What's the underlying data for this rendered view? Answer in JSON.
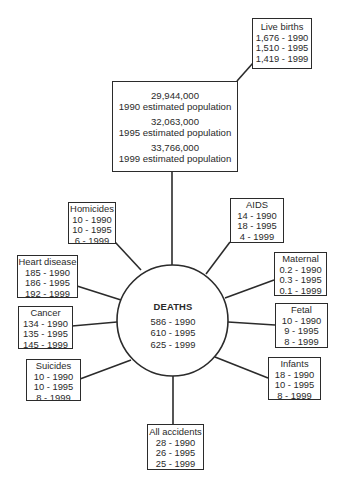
{
  "diagram": {
    "center": {
      "title": "DEATHS",
      "lines": [
        "586 - 1990",
        "610 - 1995",
        "625 - 1999"
      ]
    },
    "population": {
      "lines": [
        "29,944,000",
        "1990 estimated population",
        "32,063,000",
        "1995 estimated population",
        "33,766,000",
        "1999 estimated population"
      ]
    },
    "live_births": {
      "title": "Live births",
      "lines": [
        "1,676 - 1990",
        "1,510 - 1995",
        "1,419 - 1999"
      ]
    },
    "nodes": [
      {
        "id": "homicides",
        "title": "Homicides",
        "lines": [
          "10 - 1990",
          "10 - 1995",
          "6 - 1999"
        ]
      },
      {
        "id": "heart-disease",
        "title": "Heart disease",
        "lines": [
          "185 - 1990",
          "186 - 1995",
          "192 - 1999"
        ]
      },
      {
        "id": "cancer",
        "title": "Cancer",
        "lines": [
          "134 - 1990",
          "135 - 1995",
          "145 - 1999"
        ]
      },
      {
        "id": "suicides",
        "title": "Suicides",
        "lines": [
          "10 - 1990",
          "10 - 1995",
          "8 - 1999"
        ]
      },
      {
        "id": "all-accidents",
        "title": "All accidents",
        "lines": [
          "28 - 1990",
          "26 - 1995",
          "25 - 1999"
        ]
      },
      {
        "id": "infants",
        "title": "Infants",
        "lines": [
          "18 - 1990",
          "10 - 1995",
          "8 - 1999"
        ]
      },
      {
        "id": "fetal",
        "title": "Fetal",
        "lines": [
          "10 - 1990",
          "9 - 1995",
          "8 - 1999"
        ]
      },
      {
        "id": "maternal",
        "title": "Maternal",
        "lines": [
          "0.2 - 1990",
          "0.3 - 1995",
          "0.1 - 1999"
        ]
      },
      {
        "id": "aids",
        "title": "AIDS",
        "lines": [
          "14 - 1990",
          "18 - 1995",
          "4 - 1999"
        ]
      }
    ],
    "colors": {
      "line": "#2b2b2b",
      "text": "#2a2a2a",
      "background": "#ffffff"
    }
  }
}
